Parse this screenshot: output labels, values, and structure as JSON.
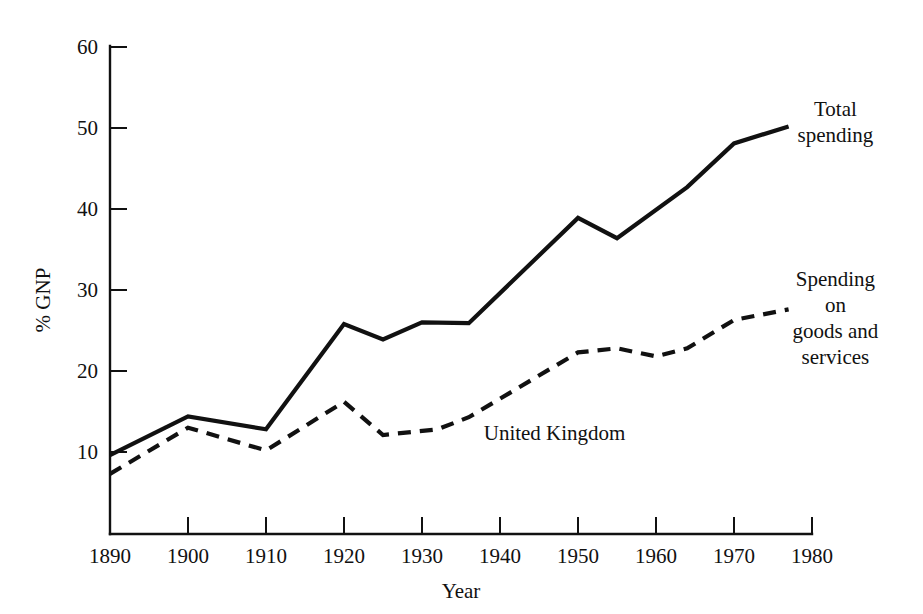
{
  "chart_data": {
    "type": "line",
    "title": "",
    "xlabel": "Year",
    "ylabel": "% GNP",
    "xlim": [
      1890,
      1980
    ],
    "ylim": [
      0,
      60
    ],
    "grid": false,
    "legend_position": "inline-right-of-series",
    "xticks": [
      1890,
      1900,
      1910,
      1920,
      1930,
      1940,
      1950,
      1960,
      1970,
      1980
    ],
    "xticklabels": [
      "1890",
      "1900",
      "1910",
      "1920",
      "1930",
      "1940",
      "1950",
      "1960",
      "1970",
      "1980"
    ],
    "yticks": [
      10,
      20,
      30,
      40,
      50,
      60
    ],
    "yticklabels": [
      "10",
      "20",
      "30",
      "40",
      "50",
      "60"
    ],
    "annotations": [
      {
        "text": "United Kingdom",
        "x": 1947,
        "y": 11.5
      }
    ],
    "series": [
      {
        "name": "Total spending",
        "style": "solid",
        "label_lines": [
          "Total",
          "spending"
        ],
        "label_x": 1983,
        "label_y": 51.5,
        "x": [
          1890,
          1900,
          1910,
          1920,
          1925,
          1930,
          1936,
          1950,
          1955,
          1964,
          1970,
          1977
        ],
        "y": [
          9.6,
          14.4,
          12.8,
          25.8,
          23.9,
          26.0,
          25.9,
          38.9,
          36.4,
          42.7,
          48.1,
          50.2
        ]
      },
      {
        "name": "Spending on goods and services",
        "style": "dashed",
        "label_lines": [
          "Spending",
          "on",
          "goods and",
          "services"
        ],
        "label_x": 1983,
        "label_y": 30.5,
        "x": [
          1890,
          1900,
          1910,
          1920,
          1925,
          1932,
          1936,
          1950,
          1955,
          1960,
          1964,
          1970,
          1977
        ],
        "y": [
          7.3,
          13.0,
          10.2,
          16.2,
          12.1,
          12.8,
          14.3,
          22.3,
          22.8,
          21.8,
          22.8,
          26.3,
          27.6
        ]
      }
    ]
  },
  "axis": {
    "y_title": "% GNP",
    "x_title": "Year"
  }
}
